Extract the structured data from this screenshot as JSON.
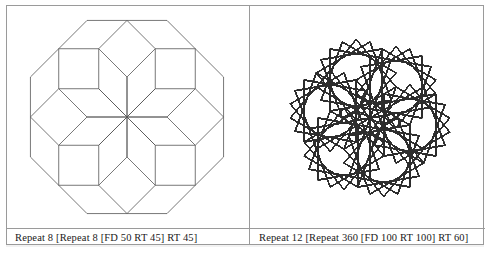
{
  "page": {
    "background_color": "#ffffff",
    "frame_color": "#9a9a9a",
    "ink_color": "#3a3a3a"
  },
  "panels": [
    {
      "id": "left",
      "caption": "Repeat 8 [Repeat 8 [FD 50 RT 45] RT 45]",
      "figure_name": "eight-octagon-rosette",
      "stroke_color": "#555555",
      "stroke_width": 0.8,
      "turtle": {
        "outer_repeat": 8,
        "outer_turn": 45,
        "inner_repeat": 8,
        "inner_turn": 45,
        "forward": 50,
        "start_heading": -90,
        "scale": 0.8,
        "center_x": 120,
        "center_y": 111
      }
    },
    {
      "id": "right",
      "caption": "Repeat 12 [Repeat 360 [FD 100 RT 100] RT 60]",
      "figure_name": "twelve-square-rosette",
      "stroke_color": "#2e2e2e",
      "stroke_width": 0.9,
      "turtle": {
        "outer_repeat": 12,
        "outer_turn": 60,
        "inner_repeat": 360,
        "inner_turn": 100,
        "forward": 100,
        "start_heading": -90,
        "scale": 0.62,
        "center_x": 120,
        "center_y": 112
      }
    }
  ]
}
